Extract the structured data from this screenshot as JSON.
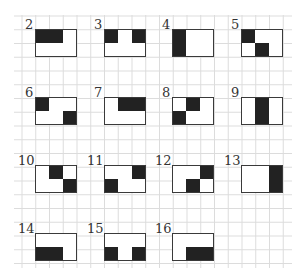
{
  "diagram": {
    "grid": {
      "rows": 2,
      "cols": 3,
      "fill_color": "#222222",
      "border_color": "#3a3a3a",
      "gridline_color": "#dcdcdc"
    },
    "items": [
      {
        "label": "2",
        "x": 35,
        "y": 29,
        "on": [
          [
            0,
            0
          ],
          [
            0,
            1
          ]
        ]
      },
      {
        "label": "3",
        "x": 104,
        "y": 29,
        "on": [
          [
            0,
            0
          ],
          [
            0,
            2
          ]
        ]
      },
      {
        "label": "4",
        "x": 172,
        "y": 29,
        "on": [
          [
            0,
            0
          ],
          [
            1,
            0
          ]
        ]
      },
      {
        "label": "5",
        "x": 241,
        "y": 29,
        "on": [
          [
            0,
            0
          ],
          [
            1,
            1
          ]
        ]
      },
      {
        "label": "6",
        "x": 35,
        "y": 97,
        "on": [
          [
            0,
            0
          ],
          [
            1,
            2
          ]
        ]
      },
      {
        "label": "7",
        "x": 104,
        "y": 97,
        "on": [
          [
            0,
            1
          ],
          [
            0,
            2
          ]
        ]
      },
      {
        "label": "8",
        "x": 172,
        "y": 97,
        "on": [
          [
            0,
            1
          ],
          [
            1,
            0
          ]
        ]
      },
      {
        "label": "9",
        "x": 241,
        "y": 97,
        "on": [
          [
            0,
            1
          ],
          [
            1,
            1
          ]
        ]
      },
      {
        "label": "10",
        "x": 35,
        "y": 165,
        "on": [
          [
            0,
            1
          ],
          [
            1,
            2
          ]
        ]
      },
      {
        "label": "11",
        "x": 104,
        "y": 165,
        "on": [
          [
            0,
            2
          ],
          [
            1,
            0
          ]
        ]
      },
      {
        "label": "12",
        "x": 172,
        "y": 165,
        "on": [
          [
            0,
            2
          ],
          [
            1,
            1
          ]
        ]
      },
      {
        "label": "13",
        "x": 241,
        "y": 165,
        "on": [
          [
            0,
            2
          ],
          [
            1,
            2
          ]
        ]
      },
      {
        "label": "14",
        "x": 35,
        "y": 233,
        "on": [
          [
            1,
            0
          ],
          [
            1,
            1
          ]
        ]
      },
      {
        "label": "15",
        "x": 104,
        "y": 233,
        "on": [
          [
            1,
            0
          ],
          [
            1,
            2
          ]
        ]
      },
      {
        "label": "16",
        "x": 172,
        "y": 233,
        "on": [
          [
            1,
            1
          ],
          [
            1,
            2
          ]
        ]
      }
    ]
  }
}
